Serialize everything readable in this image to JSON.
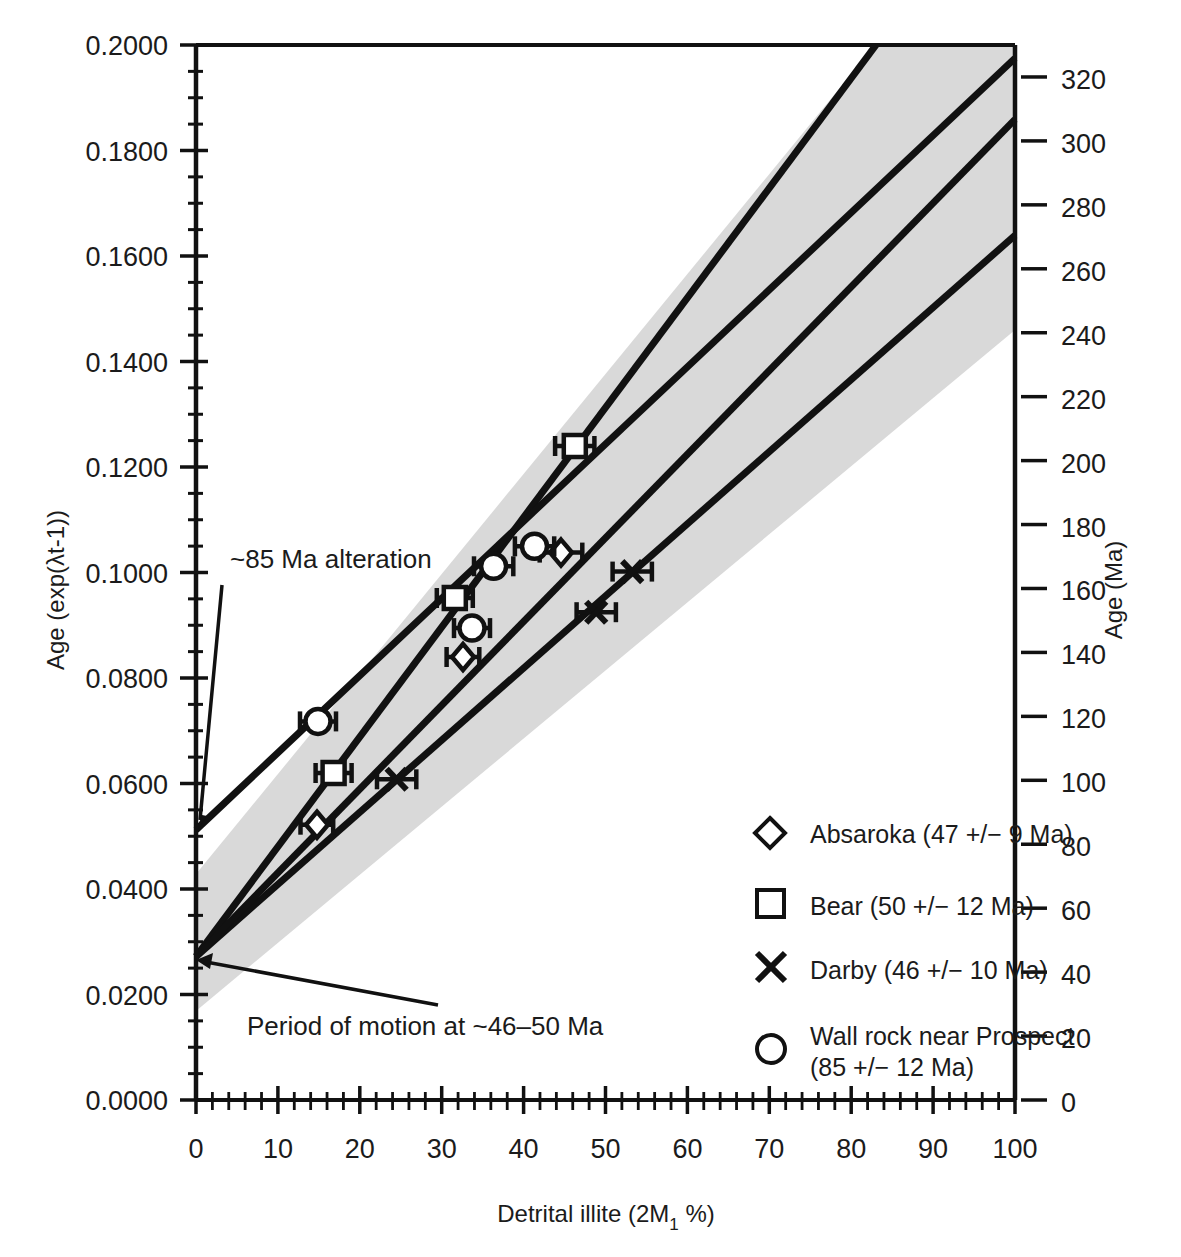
{
  "chart_data": {
    "type": "scatter",
    "title": "",
    "xlabel": "Detrital illite (2M1 %)",
    "ylabel": "Age (exp(λt-1))",
    "ylabel_right": "Age (Ma)",
    "xlim": [
      0,
      100
    ],
    "ylim": [
      0.0,
      0.2
    ],
    "ylim_right": [
      0,
      330
    ],
    "grid": false,
    "legend_position": "lower right",
    "x_ticks": [
      "0",
      "10",
      "20",
      "30",
      "40",
      "50",
      "60",
      "70",
      "80",
      "90",
      "100"
    ],
    "x_tick_values": [
      0,
      10,
      20,
      30,
      40,
      50,
      60,
      70,
      80,
      90,
      100
    ],
    "y_ticks": [
      "0.0000",
      "0.0200",
      "0.0400",
      "0.0600",
      "0.0800",
      "0.1000",
      "0.1200",
      "0.1400",
      "0.1600",
      "0.1800",
      "0.2000"
    ],
    "y_tick_values": [
      0.0,
      0.02,
      0.04,
      0.06,
      0.08,
      0.1,
      0.12,
      0.14,
      0.16,
      0.18,
      0.2
    ],
    "y_right_ticks": [
      "0",
      "20",
      "40",
      "60",
      "80",
      "100",
      "120",
      "140",
      "160",
      "180",
      "200",
      "220",
      "240",
      "260",
      "280",
      "300",
      "320"
    ],
    "y_right_tick_values": [
      0,
      20,
      40,
      60,
      80,
      100,
      120,
      140,
      160,
      180,
      200,
      220,
      240,
      260,
      280,
      300,
      320
    ],
    "series": [
      {
        "name": "Absaroka (47 +/− 9 Ma)",
        "marker": "diamond",
        "points": [
          {
            "x": 14.8,
            "y": 0.0522,
            "xerr": 2.0
          },
          {
            "x": 32.6,
            "y": 0.084,
            "xerr": 2.0
          },
          {
            "x": 44.0,
            "y": 0.1038,
            "xerr": 2.6
          }
        ],
        "fit": {
          "intercept": 0.0272,
          "x_end": 100,
          "y_end": 0.164
        }
      },
      {
        "name": "Bear (50 +/− 12 Ma)",
        "marker": "square",
        "points": [
          {
            "x": 16.8,
            "y": 0.062,
            "xerr": 2.2
          },
          {
            "x": 31.6,
            "y": 0.0952,
            "xerr": 2.2
          },
          {
            "x": 46.5,
            "y": 0.124,
            "xerr": 2.4
          }
        ],
        "fit": {
          "intercept": 0.0272,
          "x_end": 83.0,
          "y_end": 0.2
        }
      },
      {
        "name": "Darby (46 +/− 10 Ma)",
        "marker": "cross",
        "points": [
          {
            "x": 24.4,
            "y": 0.0608,
            "xerr": 2.4
          },
          {
            "x": 48.4,
            "y": 0.0925,
            "xerr": 2.4
          },
          {
            "x": 52.8,
            "y": 0.1002,
            "xerr": 2.4
          }
        ],
        "fit": {
          "intercept": 0.0272,
          "x_end": 100,
          "y_end": 0.186
        }
      },
      {
        "name": "Wall rock near Prospect (85 +/− 12 Ma)",
        "marker": "circle",
        "points": [
          {
            "x": 15.0,
            "y": 0.0718,
            "xerr": 2.2
          },
          {
            "x": 33.8,
            "y": 0.0895,
            "xerr": 2.2
          },
          {
            "x": 36.2,
            "y": 0.1012,
            "xerr": 2.4
          },
          {
            "x": 41.2,
            "y": 0.105,
            "xerr": 2.4
          }
        ],
        "fit": {
          "intercept": 0.0512,
          "x_end": 100,
          "y_end": 0.1975
        }
      }
    ],
    "band": {
      "label": "uncertainty envelope",
      "color": "#d9d9d9",
      "upper": [
        [
          0,
          0.0428
        ],
        [
          100,
          0.223
        ]
      ],
      "lower": [
        [
          0,
          0.0168
        ],
        [
          100,
          0.146
        ]
      ]
    },
    "annotations": [
      {
        "text": "~85 Ma alteration",
        "x_text": 11.5,
        "y_text": 0.1002,
        "x_point": 0.0,
        "y_point": 0.0512
      },
      {
        "text": "Period of motion at ~46–50 Ma",
        "x_text": 10.5,
        "y_text": 0.02,
        "x_point": 0.0,
        "y_point": 0.0272
      }
    ]
  },
  "legend": {
    "entries": [
      {
        "marker": "diamond",
        "label": "Absaroka (47 +/− 9 Ma)",
        "label2": ""
      },
      {
        "marker": "square",
        "label": "Bear (50 +/− 12 Ma)",
        "label2": ""
      },
      {
        "marker": "cross",
        "label": "Darby (46 +/− 10 Ma)",
        "label2": ""
      },
      {
        "marker": "circle",
        "label": "Wall rock near Prospect",
        "label2": "(85 +/− 12 Ma)"
      }
    ]
  },
  "axis_titles": {
    "left": "Age (exp(λt-1))",
    "right": "Age (Ma)",
    "bottom_main": "Detrital illite (2M",
    "bottom_sub": "1",
    "bottom_tail": " %)"
  }
}
